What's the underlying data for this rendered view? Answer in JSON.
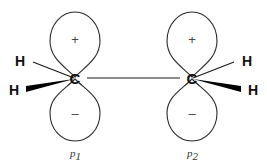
{
  "diagram": {
    "background_color": "#ffffff",
    "line_color": "#2b2b2b",
    "text_color": "#111111",
    "centers": [
      {
        "id": "left",
        "atom_label": "C",
        "orbital_name": "p",
        "orbital_subscript": "1",
        "upper_lobe_sign": "+",
        "lower_lobe_sign": "–",
        "hydrogens": [
          {
            "label": "H",
            "bond_type": "plain-line"
          },
          {
            "label": "H",
            "bond_type": "bold-wedge"
          }
        ]
      },
      {
        "id": "right",
        "atom_label": "C",
        "orbital_name": "p",
        "orbital_subscript": "2",
        "upper_lobe_sign": "+",
        "lower_lobe_sign": "–",
        "hydrogens": [
          {
            "label": "H",
            "bond_type": "plain-line"
          },
          {
            "label": "H",
            "bond_type": "bold-wedge"
          }
        ]
      }
    ],
    "central_bond": {
      "label": "",
      "type": "single-line"
    }
  }
}
